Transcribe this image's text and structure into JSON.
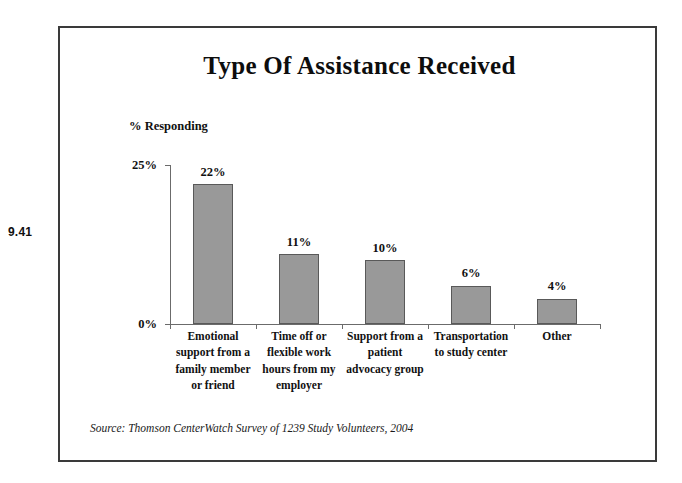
{
  "figure_number": "9.41",
  "chart_data": {
    "type": "bar",
    "title": "Type Of Assistance Received",
    "ylabel": "% Responding",
    "xlabel": "",
    "categories": [
      "Emotional support from a family member or friend",
      "Time off or flexible work hours from my employer",
      "Support  from a patient advocacy group",
      "Transportation to study center",
      "Other"
    ],
    "category_lines": [
      [
        "Emotional",
        "support from a",
        "family member",
        "or friend"
      ],
      [
        "Time off or",
        "flexible work",
        "hours from my",
        "employer"
      ],
      [
        "Support  from a",
        "patient",
        "advocacy group"
      ],
      [
        "Transportation",
        "to study center"
      ],
      [
        "Other"
      ]
    ],
    "values": [
      22,
      11,
      10,
      6,
      4
    ],
    "data_labels": [
      "22%",
      "11%",
      "10%",
      "6%",
      "4%"
    ],
    "ylim": [
      0,
      25
    ],
    "ytick_labels": [
      "25%",
      "0%"
    ],
    "ytick_values": [
      25,
      0
    ],
    "grid": false,
    "legend": false,
    "bar_color": "#999999",
    "bar_border_color": "#595959",
    "axis_color": "#6b6b6b",
    "text_color": "#111111"
  },
  "source_note": "Source: Thomson CenterWatch Survey of 1239 Study Volunteers, 2004"
}
